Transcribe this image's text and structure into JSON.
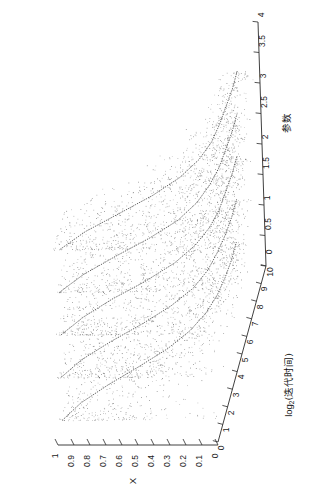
{
  "figure": {
    "kind": "3d-scatter-surface-projection",
    "rotation_deg": 90,
    "background": "#ffffff",
    "ink_color": "#2b2b2b"
  },
  "axes": {
    "x_axis": {
      "name": "x-axis-log2-iteration-time",
      "label_main": "log",
      "label_sub": "2",
      "label_tail": "(迭代时间)",
      "label_full": "log2(迭代时间)",
      "ticks": [
        "0",
        "1",
        "2",
        "3",
        "4",
        "5",
        "6",
        "7",
        "8",
        "9",
        "10"
      ],
      "range": [
        0,
        10
      ]
    },
    "y_axis": {
      "name": "y-axis-parameter",
      "label_full": "参数",
      "ticks": [
        "0",
        "0.5",
        "1",
        "1.5",
        "2",
        "2.5",
        "3",
        "3.5",
        "4"
      ],
      "range": [
        0,
        4
      ]
    },
    "z_axis": {
      "name": "z-axis-x",
      "label_full": "X",
      "ticks": [
        "0",
        "0.1",
        "0.2",
        "0.3",
        "0.4",
        "0.5",
        "0.6",
        "0.7",
        "0.8",
        "0.9",
        "1"
      ],
      "range": [
        0,
        1
      ]
    }
  },
  "chart_data": {
    "type": "scatter",
    "title": "",
    "xlabel": "log2(迭代时间)",
    "ylabel": "参数",
    "zlabel": "X",
    "xlim": [
      0,
      10
    ],
    "ylim": [
      0,
      4
    ],
    "zlim": [
      0,
      1
    ],
    "grid": false,
    "legend": "none",
    "series": [
      {
        "name": "参数 = 0.4",
        "slice_y": 0.4,
        "curve_x": [
          0,
          1,
          2,
          3,
          4,
          5,
          6,
          7,
          8,
          9,
          10
        ],
        "curve_z": [
          0.97,
          0.88,
          0.74,
          0.58,
          0.43,
          0.32,
          0.25,
          0.21,
          0.19,
          0.18,
          0.18
        ],
        "cloud_points": 900,
        "cloud_z_range": [
          0.02,
          0.99
        ]
      },
      {
        "name": "参数 = 1.1",
        "slice_y": 1.1,
        "curve_x": [
          0,
          1,
          2,
          3,
          4,
          5,
          6,
          7,
          8,
          9,
          10
        ],
        "curve_z": [
          0.97,
          0.87,
          0.72,
          0.55,
          0.4,
          0.29,
          0.23,
          0.2,
          0.18,
          0.17,
          0.17
        ],
        "cloud_points": 900,
        "cloud_z_range": [
          0.02,
          0.99
        ]
      },
      {
        "name": "参数 = 1.8",
        "slice_y": 1.8,
        "curve_x": [
          0,
          1,
          2,
          3,
          4,
          5,
          6,
          7,
          8,
          9,
          10
        ],
        "curve_z": [
          0.96,
          0.85,
          0.7,
          0.52,
          0.37,
          0.27,
          0.21,
          0.18,
          0.17,
          0.16,
          0.16
        ],
        "cloud_points": 900,
        "cloud_z_range": [
          0.02,
          0.99
        ]
      },
      {
        "name": "参数 = 2.5",
        "slice_y": 2.5,
        "curve_x": [
          0,
          1,
          2,
          3,
          4,
          5,
          6,
          7,
          8,
          9,
          10
        ],
        "curve_z": [
          0.96,
          0.84,
          0.67,
          0.49,
          0.34,
          0.25,
          0.2,
          0.17,
          0.16,
          0.15,
          0.15
        ],
        "cloud_points": 900,
        "cloud_z_range": [
          0.02,
          0.99
        ]
      },
      {
        "name": "参数 = 3.2",
        "slice_y": 3.2,
        "curve_x": [
          0,
          1,
          2,
          3,
          4,
          5,
          6,
          7,
          8,
          9,
          10
        ],
        "curve_z": [
          0.95,
          0.82,
          0.64,
          0.46,
          0.32,
          0.23,
          0.18,
          0.16,
          0.15,
          0.14,
          0.14
        ],
        "cloud_points": 900,
        "cloud_z_range": [
          0.02,
          0.99
        ]
      }
    ]
  }
}
